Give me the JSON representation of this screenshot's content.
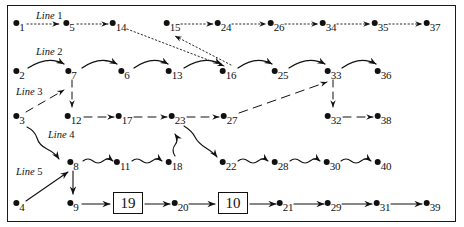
{
  "diagram": {
    "frame": {
      "x": 7,
      "y": 5,
      "w": 449,
      "h": 217,
      "border_color": "#1a1a1a"
    },
    "ink_color": "#111111",
    "background": "#ffffff",
    "line_labels": [
      {
        "name": "line-1",
        "word": "Line",
        "num": "1",
        "x": 36,
        "y": 11
      },
      {
        "name": "line-2",
        "word": "Line",
        "num": "2",
        "x": 36,
        "y": 47
      },
      {
        "name": "line-3",
        "word": "Line",
        "num": "3",
        "x": 16,
        "y": 87
      },
      {
        "name": "line-4",
        "word": "Line",
        "num": "4",
        "x": 48,
        "y": 130
      },
      {
        "name": "line-5",
        "word": "Line",
        "num": "5",
        "x": 16,
        "y": 167
      }
    ],
    "rows": [
      {
        "name": "row-1-dotted",
        "style": "dotted",
        "y": 24
      },
      {
        "name": "row-2-curved",
        "style": "curved",
        "y": 72
      },
      {
        "name": "row-3-dashed",
        "style": "dashed",
        "y": 117
      },
      {
        "name": "row-4-wavy",
        "style": "wavy",
        "y": 163
      },
      {
        "name": "row-5-solid",
        "style": "solid",
        "y": 204
      }
    ],
    "nodes": [
      {
        "id": "n1",
        "label": "1",
        "x": 19,
        "y": 24,
        "shape": "dot",
        "row": 1
      },
      {
        "id": "n5",
        "label": "5",
        "x": 69,
        "y": 24,
        "shape": "dot",
        "row": 1
      },
      {
        "id": "n14",
        "label": "14",
        "x": 118,
        "y": 24,
        "shape": "dot",
        "row": 1
      },
      {
        "id": "n15",
        "label": "15",
        "x": 172,
        "y": 24,
        "shape": "dot",
        "row": 1
      },
      {
        "id": "n24",
        "label": "24",
        "x": 223,
        "y": 24,
        "shape": "dot",
        "row": 1
      },
      {
        "id": "n26",
        "label": "26",
        "x": 276,
        "y": 24,
        "shape": "dot",
        "row": 1
      },
      {
        "id": "n34",
        "label": "34",
        "x": 328,
        "y": 24,
        "shape": "dot",
        "row": 1
      },
      {
        "id": "n35",
        "label": "35",
        "x": 380,
        "y": 24,
        "shape": "dot",
        "row": 1
      },
      {
        "id": "n37",
        "label": "37",
        "x": 432,
        "y": 24,
        "shape": "dot",
        "row": 1
      },
      {
        "id": "n2",
        "label": "2",
        "x": 19,
        "y": 72,
        "shape": "dot",
        "row": 2
      },
      {
        "id": "n7",
        "label": "7",
        "x": 71,
        "y": 72,
        "shape": "dot",
        "row": 2
      },
      {
        "id": "n6",
        "label": "6",
        "x": 124,
        "y": 72,
        "shape": "dot",
        "row": 2
      },
      {
        "id": "n13",
        "label": "13",
        "x": 174,
        "y": 72,
        "shape": "dot",
        "row": 2
      },
      {
        "id": "n16",
        "label": "16",
        "x": 228,
        "y": 72,
        "shape": "dot",
        "row": 2
      },
      {
        "id": "n25",
        "label": "25",
        "x": 280,
        "y": 72,
        "shape": "dot",
        "row": 2
      },
      {
        "id": "n33",
        "label": "33",
        "x": 333,
        "y": 72,
        "shape": "dot",
        "row": 2
      },
      {
        "id": "n36",
        "label": "36",
        "x": 383,
        "y": 72,
        "shape": "dot",
        "row": 2
      },
      {
        "id": "n3",
        "label": "3",
        "x": 19,
        "y": 117,
        "shape": "dot",
        "row": 3
      },
      {
        "id": "n12",
        "label": "12",
        "x": 73,
        "y": 117,
        "shape": "dot",
        "row": 3
      },
      {
        "id": "n17",
        "label": "17",
        "x": 124,
        "y": 117,
        "shape": "dot",
        "row": 3
      },
      {
        "id": "n23",
        "label": "23",
        "x": 177,
        "y": 117,
        "shape": "dot",
        "row": 3
      },
      {
        "id": "n27",
        "label": "27",
        "x": 229,
        "y": 117,
        "shape": "dot",
        "row": 3
      },
      {
        "id": "n32",
        "label": "32",
        "x": 333,
        "y": 117,
        "shape": "dot",
        "row": 3
      },
      {
        "id": "n38",
        "label": "38",
        "x": 383,
        "y": 117,
        "shape": "dot",
        "row": 3
      },
      {
        "id": "n8",
        "label": "8",
        "x": 73,
        "y": 163,
        "shape": "dot",
        "row": 4
      },
      {
        "id": "n11",
        "label": "11",
        "x": 122,
        "y": 163,
        "shape": "dot",
        "row": 4
      },
      {
        "id": "n18",
        "label": "18",
        "x": 174,
        "y": 163,
        "shape": "dot",
        "row": 4
      },
      {
        "id": "n22",
        "label": "22",
        "x": 228,
        "y": 163,
        "shape": "dot",
        "row": 4
      },
      {
        "id": "n28",
        "label": "28",
        "x": 280,
        "y": 163,
        "shape": "dot",
        "row": 4
      },
      {
        "id": "n30",
        "label": "30",
        "x": 332,
        "y": 163,
        "shape": "dot",
        "row": 4
      },
      {
        "id": "n40",
        "label": "40",
        "x": 383,
        "y": 163,
        "shape": "dot",
        "row": 4
      },
      {
        "id": "n4",
        "label": "4",
        "x": 19,
        "y": 204,
        "shape": "dot",
        "row": 5
      },
      {
        "id": "n9",
        "label": "9",
        "x": 73,
        "y": 204,
        "shape": "dot",
        "row": 5
      },
      {
        "id": "n19",
        "label": "19",
        "x": 128,
        "y": 203,
        "shape": "box",
        "row": 5
      },
      {
        "id": "n20",
        "label": "20",
        "x": 180,
        "y": 204,
        "shape": "dot",
        "row": 5
      },
      {
        "id": "n10",
        "label": "10",
        "x": 233,
        "y": 203,
        "shape": "box",
        "row": 5
      },
      {
        "id": "n21",
        "label": "21",
        "x": 285,
        "y": 204,
        "shape": "dot",
        "row": 5
      },
      {
        "id": "n29",
        "label": "29",
        "x": 333,
        "y": 204,
        "shape": "dot",
        "row": 5
      },
      {
        "id": "n31",
        "label": "31",
        "x": 382,
        "y": 204,
        "shape": "dot",
        "row": 5
      },
      {
        "id": "n39",
        "label": "39",
        "x": 432,
        "y": 204,
        "shape": "dot",
        "row": 5
      }
    ],
    "edges": [
      {
        "name": "edge-1-to-5",
        "from": "n1",
        "to": "n5",
        "style": "dotted"
      },
      {
        "name": "edge-5-to-14",
        "from": "n5",
        "to": "n14",
        "style": "dotted"
      },
      {
        "name": "edge-15-to-24",
        "from": "n15",
        "to": "n24",
        "style": "dotted"
      },
      {
        "name": "edge-24-to-26",
        "from": "n24",
        "to": "n26",
        "style": "dotted"
      },
      {
        "name": "edge-26-to-34",
        "from": "n26",
        "to": "n34",
        "style": "dotted"
      },
      {
        "name": "edge-34-to-35",
        "from": "n34",
        "to": "n35",
        "style": "dotted"
      },
      {
        "name": "edge-35-to-37",
        "from": "n35",
        "to": "n37",
        "style": "dotted"
      },
      {
        "name": "edge-14-to-16",
        "from": "n14",
        "to": "n16",
        "style": "dotted-diagonal"
      },
      {
        "name": "edge-16-to-15",
        "from": "n16",
        "to": "n15",
        "style": "dotted-diagonal"
      },
      {
        "name": "edge-2-to-7",
        "from": "n2",
        "to": "n7",
        "style": "curved"
      },
      {
        "name": "edge-7-to-6",
        "from": "n7",
        "to": "n6",
        "style": "curved"
      },
      {
        "name": "edge-6-to-13",
        "from": "n6",
        "to": "n13",
        "style": "curved"
      },
      {
        "name": "edge-13-to-16",
        "from": "n13",
        "to": "n16",
        "style": "curved"
      },
      {
        "name": "edge-16-to-25",
        "from": "n16",
        "to": "n25",
        "style": "curved"
      },
      {
        "name": "edge-25-to-33",
        "from": "n25",
        "to": "n33",
        "style": "curved"
      },
      {
        "name": "edge-33-to-36",
        "from": "n33",
        "to": "n36",
        "style": "curved"
      },
      {
        "name": "edge-7-to-12",
        "from": "n7",
        "to": "n12",
        "style": "vertical-dashed"
      },
      {
        "name": "edge-3-to-12",
        "from": "n3",
        "to": "n12",
        "style": "dashed-diagonal"
      },
      {
        "name": "edge-12-to-17",
        "from": "n12",
        "to": "n17",
        "style": "dashed"
      },
      {
        "name": "edge-17-to-23",
        "from": "n17",
        "to": "n23",
        "style": "dashed"
      },
      {
        "name": "edge-23-to-27",
        "from": "n23",
        "to": "n27",
        "style": "dashed"
      },
      {
        "name": "edge-27-to-33",
        "from": "n27",
        "to": "n33",
        "style": "dashed-diagonal"
      },
      {
        "name": "edge-33-to-32",
        "from": "n33",
        "to": "n32",
        "style": "vertical-dashed"
      },
      {
        "name": "edge-32-to-38",
        "from": "n32",
        "to": "n38",
        "style": "dashed"
      },
      {
        "name": "edge-3-to-8",
        "from": "n3",
        "to": "n8",
        "style": "wavy-diagonal"
      },
      {
        "name": "edge-8-to-11",
        "from": "n8",
        "to": "n11",
        "style": "wavy"
      },
      {
        "name": "edge-11-to-18",
        "from": "n11",
        "to": "n18",
        "style": "wavy"
      },
      {
        "name": "edge-18-to-23",
        "from": "n18",
        "to": "n23",
        "style": "wavy-vertical"
      },
      {
        "name": "edge-23-to-22",
        "from": "n23",
        "to": "n22",
        "style": "wavy-diagonal"
      },
      {
        "name": "edge-22-to-28",
        "from": "n22",
        "to": "n28",
        "style": "wavy"
      },
      {
        "name": "edge-28-to-30",
        "from": "n28",
        "to": "n30",
        "style": "wavy"
      },
      {
        "name": "edge-30-to-40",
        "from": "n30",
        "to": "n40",
        "style": "wavy"
      },
      {
        "name": "edge-4-to-8",
        "from": "n4",
        "to": "n8",
        "style": "solid-diagonal"
      },
      {
        "name": "edge-8-to-9",
        "from": "n8",
        "to": "n9",
        "style": "solid-vertical"
      },
      {
        "name": "edge-9-to-19",
        "from": "n9",
        "to": "n19",
        "style": "solid"
      },
      {
        "name": "edge-19-to-20",
        "from": "n19",
        "to": "n20",
        "style": "solid"
      },
      {
        "name": "edge-20-to-10",
        "from": "n20",
        "to": "n10",
        "style": "solid"
      },
      {
        "name": "edge-10-to-21",
        "from": "n10",
        "to": "n21",
        "style": "solid"
      },
      {
        "name": "edge-21-to-29",
        "from": "n21",
        "to": "n29",
        "style": "solid"
      },
      {
        "name": "edge-29-to-31",
        "from": "n29",
        "to": "n31",
        "style": "solid"
      },
      {
        "name": "edge-31-to-39",
        "from": "n31",
        "to": "n39",
        "style": "solid"
      }
    ]
  }
}
